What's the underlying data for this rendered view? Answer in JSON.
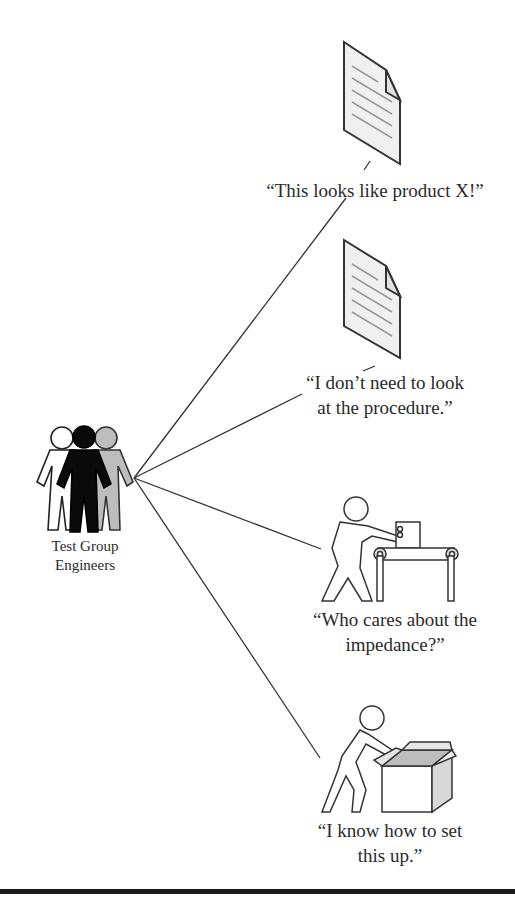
{
  "diagram": {
    "group": {
      "label_line1": "Test Group",
      "label_line2": "Engineers",
      "figures": [
        "white",
        "black",
        "gray"
      ]
    },
    "thoughts": [
      {
        "id": "doc1",
        "icon": "document-icon",
        "caption": "“This looks like product X!”"
      },
      {
        "id": "doc2",
        "icon": "document-icon",
        "caption_line1": "“I don’t need to look",
        "caption_line2": "at the procedure.”"
      },
      {
        "id": "conveyor",
        "icon": "person-at-conveyor-icon",
        "caption_line1": "“Who cares about the",
        "caption_line2": "impedance?”"
      },
      {
        "id": "box",
        "icon": "person-opening-box-icon",
        "caption_line1": "“I know how to set",
        "caption_line2": "this up.”"
      }
    ],
    "colors": {
      "line": "#333333",
      "doc_fill": "#f0f0f0",
      "gray_figure": "#bdbdbd",
      "black_figure": "#0a0a0a"
    }
  }
}
